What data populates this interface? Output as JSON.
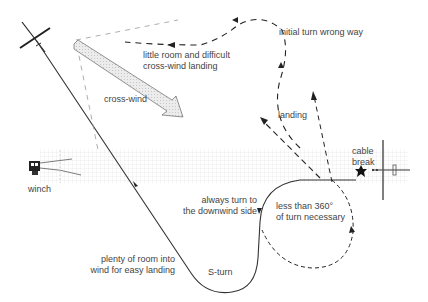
{
  "diagram": {
    "topic": "cable break during winch launch",
    "labels": {
      "initial_turn": "initial turn wrong way",
      "little_room_1": "little room and difficult",
      "little_room_2": "cross-wind landing",
      "cross_wind": "cross-wind",
      "landing": "landing",
      "cable_1": "cable",
      "cable_2": "break",
      "winch": "winch",
      "always_turn_1": "always turn to",
      "always_turn_2": "the downwind side",
      "less_than_1": "less than 360°",
      "less_than_2": "of turn necessary",
      "plenty_1": "plenty of room into",
      "plenty_2": "wind for easy landing",
      "s_turn": "S-turn"
    },
    "colors": {
      "line": "#333333",
      "dashed": "#222222",
      "light_dashed": "#999999",
      "grid": "#d8d8d8",
      "arrow_fill": "#e6e6e6",
      "text": "#444444"
    }
  }
}
